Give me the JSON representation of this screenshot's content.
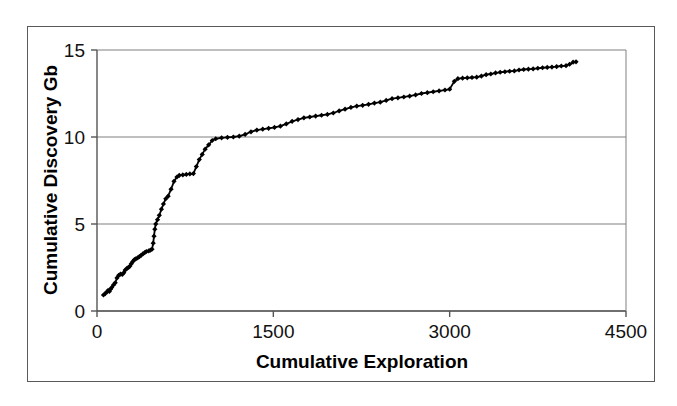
{
  "chart_data": {
    "type": "line",
    "title": "",
    "subtitle": "",
    "xlabel": "Cumulative Exploration",
    "ylabel": "Cumulative Discovery Gb",
    "xlim": [
      0,
      4500
    ],
    "ylim": [
      0,
      15
    ],
    "xticks": [
      0,
      1500,
      3000,
      4500
    ],
    "yticks": [
      0,
      5,
      10,
      15
    ],
    "xtick_labels": [
      "0",
      "1500",
      "3000",
      "4500"
    ],
    "ytick_labels": [
      "0",
      "5",
      "10",
      "15"
    ],
    "grid": "horizontal",
    "legend": "none",
    "marker": "diamond",
    "line_color": "#000000",
    "marker_color": "#000000",
    "grid_color": "#808080",
    "axis_color": "#555555",
    "frame_color": "#5a5a5a",
    "background": "#ffffff",
    "series": [
      {
        "name": "Cumulative Discovery",
        "points": [
          [
            55,
            0.92
          ],
          [
            70,
            1.0
          ],
          [
            85,
            1.1
          ],
          [
            95,
            1.18
          ],
          [
            105,
            1.12
          ],
          [
            115,
            1.25
          ],
          [
            125,
            1.35
          ],
          [
            140,
            1.5
          ],
          [
            155,
            1.62
          ],
          [
            170,
            1.9
          ],
          [
            185,
            2.05
          ],
          [
            200,
            2.12
          ],
          [
            215,
            2.1
          ],
          [
            228,
            2.2
          ],
          [
            240,
            2.35
          ],
          [
            255,
            2.45
          ],
          [
            268,
            2.5
          ],
          [
            280,
            2.58
          ],
          [
            292,
            2.72
          ],
          [
            305,
            2.85
          ],
          [
            318,
            2.95
          ],
          [
            330,
            3.0
          ],
          [
            345,
            3.05
          ],
          [
            360,
            3.12
          ],
          [
            375,
            3.2
          ],
          [
            390,
            3.28
          ],
          [
            405,
            3.35
          ],
          [
            420,
            3.42
          ],
          [
            440,
            3.45
          ],
          [
            455,
            3.5
          ],
          [
            468,
            3.55
          ],
          [
            478,
            3.9
          ],
          [
            485,
            4.3
          ],
          [
            492,
            4.7
          ],
          [
            500,
            5.0
          ],
          [
            515,
            5.25
          ],
          [
            530,
            5.5
          ],
          [
            548,
            5.85
          ],
          [
            565,
            6.15
          ],
          [
            585,
            6.45
          ],
          [
            605,
            6.6
          ],
          [
            630,
            7.0
          ],
          [
            655,
            7.45
          ],
          [
            680,
            7.7
          ],
          [
            700,
            7.8
          ],
          [
            730,
            7.82
          ],
          [
            760,
            7.85
          ],
          [
            790,
            7.88
          ],
          [
            820,
            7.9
          ],
          [
            845,
            8.3
          ],
          [
            870,
            8.7
          ],
          [
            895,
            9.0
          ],
          [
            920,
            9.3
          ],
          [
            950,
            9.55
          ],
          [
            980,
            9.8
          ],
          [
            1010,
            9.9
          ],
          [
            1060,
            9.95
          ],
          [
            1110,
            9.98
          ],
          [
            1160,
            10.0
          ],
          [
            1210,
            10.05
          ],
          [
            1260,
            10.15
          ],
          [
            1310,
            10.3
          ],
          [
            1360,
            10.4
          ],
          [
            1410,
            10.45
          ],
          [
            1460,
            10.5
          ],
          [
            1510,
            10.55
          ],
          [
            1560,
            10.62
          ],
          [
            1610,
            10.75
          ],
          [
            1660,
            10.9
          ],
          [
            1710,
            11.0
          ],
          [
            1760,
            11.1
          ],
          [
            1810,
            11.15
          ],
          [
            1860,
            11.2
          ],
          [
            1910,
            11.25
          ],
          [
            1960,
            11.3
          ],
          [
            2010,
            11.38
          ],
          [
            2060,
            11.5
          ],
          [
            2110,
            11.6
          ],
          [
            2160,
            11.7
          ],
          [
            2210,
            11.78
          ],
          [
            2260,
            11.82
          ],
          [
            2310,
            11.88
          ],
          [
            2360,
            11.95
          ],
          [
            2410,
            12.0
          ],
          [
            2460,
            12.1
          ],
          [
            2510,
            12.2
          ],
          [
            2560,
            12.25
          ],
          [
            2610,
            12.3
          ],
          [
            2660,
            12.35
          ],
          [
            2710,
            12.42
          ],
          [
            2760,
            12.5
          ],
          [
            2810,
            12.55
          ],
          [
            2860,
            12.6
          ],
          [
            2910,
            12.65
          ],
          [
            2960,
            12.7
          ],
          [
            3000,
            12.75
          ],
          [
            3040,
            13.2
          ],
          [
            3070,
            13.35
          ],
          [
            3110,
            13.38
          ],
          [
            3150,
            13.4
          ],
          [
            3190,
            13.42
          ],
          [
            3230,
            13.44
          ],
          [
            3270,
            13.5
          ],
          [
            3310,
            13.58
          ],
          [
            3350,
            13.62
          ],
          [
            3390,
            13.68
          ],
          [
            3430,
            13.72
          ],
          [
            3470,
            13.75
          ],
          [
            3510,
            13.78
          ],
          [
            3550,
            13.8
          ],
          [
            3590,
            13.85
          ],
          [
            3630,
            13.88
          ],
          [
            3670,
            13.9
          ],
          [
            3710,
            13.92
          ],
          [
            3750,
            13.95
          ],
          [
            3790,
            13.98
          ],
          [
            3830,
            14.0
          ],
          [
            3870,
            14.02
          ],
          [
            3910,
            14.05
          ],
          [
            3950,
            14.08
          ],
          [
            3990,
            14.1
          ],
          [
            4020,
            14.18
          ],
          [
            4050,
            14.3
          ],
          [
            4075,
            14.32
          ]
        ]
      }
    ]
  },
  "figure": {
    "caption": ""
  }
}
